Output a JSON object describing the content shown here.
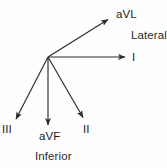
{
  "figure": {
    "background_color": "#fefefe",
    "line_color": "#2b2b2b",
    "text_color": "#1c1c1c"
  },
  "origin": {
    "x": 48,
    "y": 57
  },
  "leads": [
    {
      "id": "aVL",
      "label": "aVL",
      "angle_degrees": -30,
      "tip": {
        "x": 110,
        "y": 18
      },
      "label_pos": {
        "x": 116,
        "y": 9
      }
    },
    {
      "id": "I",
      "label": "I",
      "angle_degrees": 0,
      "tip": {
        "x": 128,
        "y": 57
      },
      "label_pos": {
        "x": 132,
        "y": 52
      }
    },
    {
      "id": "II",
      "label": "II",
      "angle_degrees": 60,
      "tip": {
        "x": 85,
        "y": 120
      },
      "label_pos": {
        "x": 83,
        "y": 124
      }
    },
    {
      "id": "aVF",
      "label": "aVF",
      "angle_degrees": 90,
      "tip": {
        "x": 48,
        "y": 128
      },
      "label_pos": {
        "x": 39,
        "y": 131
      }
    },
    {
      "id": "III",
      "label": "III",
      "angle_degrees": 120,
      "tip": {
        "x": 14,
        "y": 122
      },
      "label_pos": {
        "x": 2,
        "y": 124
      }
    }
  ],
  "regions": [
    {
      "id": "lateral",
      "label": "Lateral",
      "label_pos": {
        "x": 131,
        "y": 30
      }
    },
    {
      "id": "inferior",
      "label": "Inferior",
      "label_pos": {
        "x": 35,
        "y": 151
      }
    }
  ]
}
